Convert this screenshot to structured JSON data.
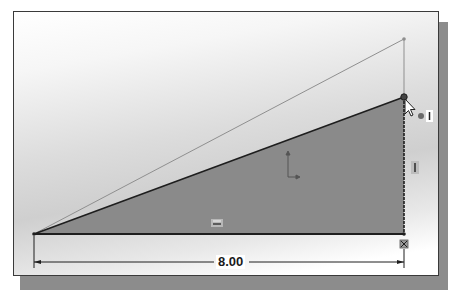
{
  "sketch": {
    "dimension": {
      "value": "8.00",
      "orientation": "horizontal"
    },
    "relations": {
      "horizontal_glyph": "=",
      "vertical_glyph": "I",
      "fixed_glyph": "⊠",
      "cursor_relation_glyph": "I"
    },
    "colors": {
      "triangle_fill": "#8a8a8a",
      "sketch_line": "#1e1e1e",
      "ghost_line": "#8f8f8f",
      "background_top": "#ffffff",
      "background_mid": "#cfcfcf"
    },
    "icons": {
      "cursor": "arrow-cursor-icon",
      "origin": "origin-axes-icon"
    }
  }
}
